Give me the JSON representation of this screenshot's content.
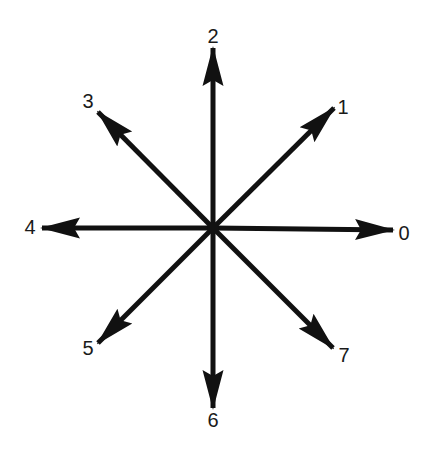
{
  "diagram": {
    "center": {
      "x": 213,
      "y": 228
    },
    "stroke_color": "#111111",
    "label_color": "#1a1a1a",
    "directions": [
      {
        "label": "0",
        "angle_deg": 0,
        "tip": {
          "x": 393,
          "y": 230
        },
        "label_pos": {
          "x": 404,
          "y": 240
        }
      },
      {
        "label": "1",
        "angle_deg": 45,
        "tip": {
          "x": 334,
          "y": 108
        },
        "label_pos": {
          "x": 343,
          "y": 114
        }
      },
      {
        "label": "2",
        "angle_deg": 90,
        "tip": {
          "x": 213,
          "y": 48
        },
        "label_pos": {
          "x": 213,
          "y": 43
        }
      },
      {
        "label": "3",
        "angle_deg": 135,
        "tip": {
          "x": 98,
          "y": 112
        },
        "label_pos": {
          "x": 88,
          "y": 108
        }
      },
      {
        "label": "4",
        "angle_deg": 180,
        "tip": {
          "x": 42,
          "y": 228
        },
        "label_pos": {
          "x": 30,
          "y": 234
        }
      },
      {
        "label": "5",
        "angle_deg": 225,
        "tip": {
          "x": 98,
          "y": 343
        },
        "label_pos": {
          "x": 88,
          "y": 355
        }
      },
      {
        "label": "6",
        "angle_deg": 270,
        "tip": {
          "x": 213,
          "y": 408
        },
        "label_pos": {
          "x": 213,
          "y": 427
        }
      },
      {
        "label": "7",
        "angle_deg": 315,
        "tip": {
          "x": 333,
          "y": 348
        },
        "label_pos": {
          "x": 344,
          "y": 362
        }
      }
    ]
  }
}
